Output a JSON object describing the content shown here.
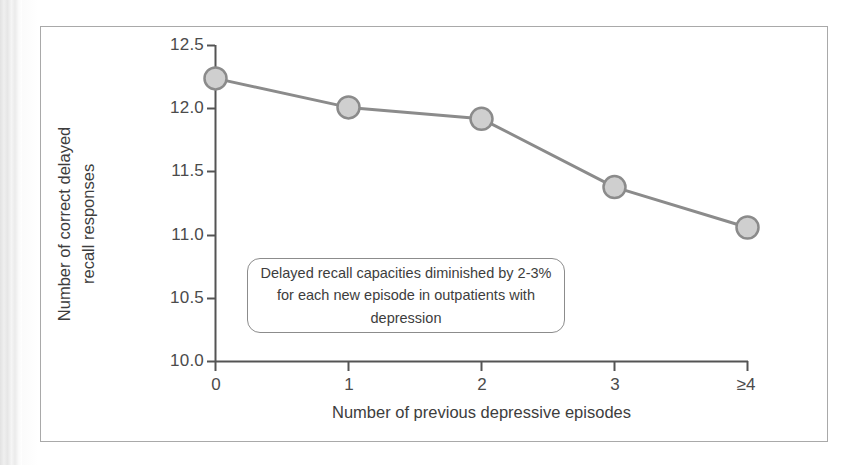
{
  "figure": {
    "background_color": "#ffffff",
    "frame_color": "#a9a9a9"
  },
  "chart_data": {
    "type": "line",
    "title": "",
    "subtitle": "",
    "xlabel": "Number of previous depressive episodes",
    "ylabel_line1": "Number of correct delayed",
    "ylabel_line2": "recall responses",
    "ylabel": "Number of correct delayed recall responses",
    "categories": [
      "0",
      "1",
      "2",
      "3",
      "≥4"
    ],
    "values": [
      12.24,
      12.01,
      11.92,
      11.38,
      11.06
    ],
    "series": [
      {
        "name": "Delayed recall",
        "values": [
          12.24,
          12.01,
          11.92,
          11.38,
          11.06
        ]
      }
    ],
    "ylim": [
      10.0,
      12.5
    ],
    "yticks": [
      "12.5",
      "12.0",
      "11.5",
      "11.0",
      "10.5",
      "10.0"
    ],
    "ytick_values": [
      12.5,
      12.0,
      11.5,
      11.0,
      10.5,
      10.0
    ],
    "xticks": [
      "0",
      "1",
      "2",
      "3",
      "≥4"
    ],
    "grid": false,
    "legend": false,
    "legend_position": "none",
    "line_color": "#8b8b8b",
    "marker_fill_color": "#cfcfcf",
    "marker_edge_color": "#8b8b8b",
    "axis_color": "#545454",
    "annotations": [
      {
        "line1": "Delayed recall capacities diminished by 2-3%",
        "line2": "for each new episode in outpatients with",
        "line3": "depression",
        "text": "Delayed recall capacities diminished by 2-3% for each new episode in outpatients with depression"
      }
    ]
  }
}
